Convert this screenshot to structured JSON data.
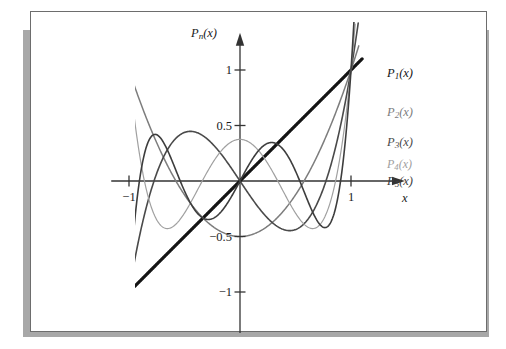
{
  "figure": {
    "frame_border_color": "#6d6d6d",
    "shadow_color": "#a8a8a8",
    "background": "#ffffff"
  },
  "axes": {
    "y_axis_label": "P",
    "y_axis_label_sub": "n",
    "y_axis_label_arg": "(x)",
    "x_axis_label": "x",
    "axis_color": "#333333",
    "y_ticks": [
      {
        "value": 1,
        "label": "1"
      },
      {
        "value": 0.5,
        "label": "0.5"
      },
      {
        "value": -0.5,
        "label": "−0.5"
      },
      {
        "value": -1,
        "label": "−1"
      }
    ],
    "x_ticks": [
      {
        "value": -1,
        "label": "−1"
      },
      {
        "value": 1,
        "label": "1"
      }
    ]
  },
  "legend": [
    {
      "name": "P",
      "sub": "1",
      "arg": "(x)",
      "color": "#141414"
    },
    {
      "name": "P",
      "sub": "2",
      "arg": "(x)",
      "color": "#7d7d7d"
    },
    {
      "name": "P",
      "sub": "3",
      "arg": "(x)",
      "color": "#4a4a4a"
    },
    {
      "name": "P",
      "sub": "4",
      "arg": "(x)",
      "color": "#a0a0a0"
    },
    {
      "name": "P",
      "sub": "5",
      "arg": "(x)",
      "color": "#3d3d3d"
    }
  ],
  "chart_data": {
    "type": "line",
    "title": "",
    "xlabel": "x",
    "ylabel": "P_n(x)",
    "xlim": [
      -1.16,
      1.45
    ],
    "ylim": [
      -1.28,
      1.28
    ],
    "grid": false,
    "legend_position": "right-inline",
    "x_ticks": [
      -1,
      1
    ],
    "y_ticks": [
      -1,
      -0.5,
      0.5,
      1
    ],
    "x": [
      -1.05,
      -1.0,
      -0.9,
      -0.8,
      -0.7,
      -0.6,
      -0.5,
      -0.4,
      -0.3,
      -0.2,
      -0.1,
      0.0,
      0.1,
      0.2,
      0.3,
      0.4,
      0.5,
      0.6,
      0.7,
      0.8,
      0.9,
      1.0,
      1.05
    ],
    "series": [
      {
        "name": "P1(x)",
        "color": "#141414",
        "linewidth": 3.2,
        "formula": "x",
        "values": [
          -1.05,
          -1.0,
          -0.9,
          -0.8,
          -0.7,
          -0.6,
          -0.5,
          -0.4,
          -0.3,
          -0.2,
          -0.1,
          0.0,
          0.1,
          0.2,
          0.3,
          0.4,
          0.5,
          0.6,
          0.7,
          0.8,
          0.9,
          1.0,
          1.05
        ]
      },
      {
        "name": "P2(x)",
        "color": "#7d7d7d",
        "linewidth": 1.5,
        "formula": "(3x^2 - 1)/2",
        "values": [
          1.154,
          1.0,
          0.715,
          0.46,
          0.235,
          0.04,
          -0.125,
          -0.26,
          -0.365,
          -0.44,
          -0.485,
          -0.5,
          -0.485,
          -0.44,
          -0.365,
          -0.26,
          -0.125,
          0.04,
          0.235,
          0.46,
          0.715,
          1.0,
          1.154
        ]
      },
      {
        "name": "P3(x)",
        "color": "#4a4a4a",
        "linewidth": 1.6,
        "formula": "(5x^3 - 3x)/2",
        "values": [
          -1.318,
          -1.0,
          -0.472,
          -0.08,
          0.193,
          0.36,
          0.438,
          0.44,
          0.383,
          0.28,
          0.148,
          0.0,
          -0.148,
          -0.28,
          -0.383,
          -0.44,
          -0.438,
          -0.36,
          -0.193,
          0.08,
          0.472,
          1.0,
          1.318
        ]
      },
      {
        "name": "P4(x)",
        "color": "#a0a0a0",
        "linewidth": 1.2,
        "formula": "(35x^4 - 30x^2 + 3)/8",
        "values": [
          1.542,
          1.0,
          0.208,
          -0.233,
          -0.413,
          -0.408,
          -0.289,
          -0.113,
          0.073,
          0.232,
          0.334,
          0.375,
          0.334,
          0.232,
          0.073,
          -0.113,
          -0.289,
          -0.408,
          -0.413,
          -0.233,
          0.208,
          1.0,
          1.542
        ]
      },
      {
        "name": "P5(x)",
        "color": "#3d3d3d",
        "linewidth": 1.6,
        "formula": "(63x^5 - 70x^3 + 15x)/8",
        "values": [
          -1.724,
          -1.0,
          0.041,
          0.399,
          0.365,
          0.152,
          -0.089,
          -0.271,
          -0.346,
          -0.307,
          -0.179,
          0.0,
          0.179,
          0.307,
          0.346,
          0.271,
          0.089,
          -0.152,
          -0.365,
          -0.399,
          -0.041,
          1.0,
          1.724
        ]
      }
    ]
  }
}
